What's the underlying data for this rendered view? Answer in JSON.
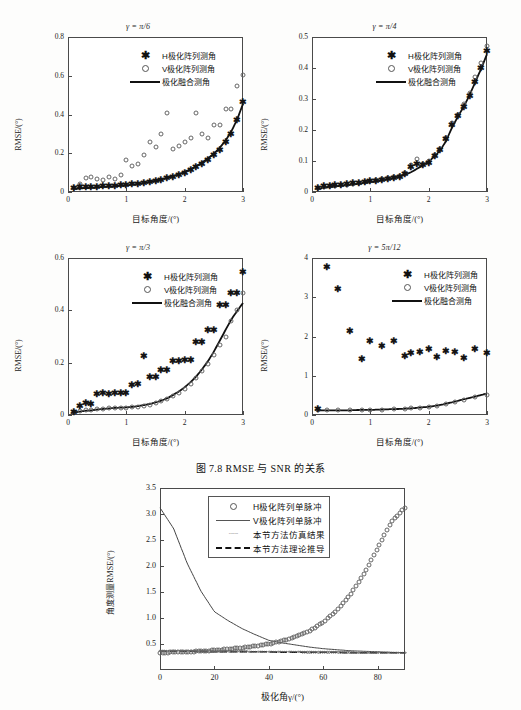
{
  "document": {
    "caption": "图 7.8   RMSE 与 SNR 的关系"
  },
  "legend_common": {
    "h_label": "H极化阵列测角",
    "v_label": "V极化阵列测角",
    "fusion_label": "极化融合测角"
  },
  "axis_labels": {
    "x_top": "目标角度/(°)",
    "y_top": "RMSE/(°)",
    "x_bottom": "极化角γ/(°)",
    "y_bottom": "角度测量RMSE/(°)"
  },
  "panels": [
    {
      "id": "panel-pi-6",
      "title": "γ = π/6",
      "xticks": [
        "0",
        "1",
        "2",
        "3"
      ],
      "yticks": [
        "0",
        "0.2",
        "0.4",
        "0.6",
        "0.8"
      ],
      "xlim": [
        0,
        3
      ],
      "ylim": [
        0,
        0.8
      ]
    },
    {
      "id": "panel-pi-4",
      "title": "γ = π/4",
      "xticks": [
        "0",
        "1",
        "2",
        "3"
      ],
      "yticks": [
        "0",
        "0.1",
        "0.2",
        "0.3",
        "0.4",
        "0.5"
      ],
      "xlim": [
        0,
        3
      ],
      "ylim": [
        0,
        0.5
      ]
    },
    {
      "id": "panel-pi-3",
      "title": "γ = π/3",
      "xticks": [
        "0",
        "1",
        "2",
        "3"
      ],
      "yticks": [
        "0",
        "0.2",
        "0.4",
        "0.6"
      ],
      "xlim": [
        0,
        3
      ],
      "ylim": [
        0,
        0.6
      ]
    },
    {
      "id": "panel-5pi-12",
      "title": "γ = 5π/12",
      "xticks": [
        "0",
        "1",
        "2",
        "3"
      ],
      "yticks": [
        "0",
        "1",
        "2",
        "3",
        "4"
      ],
      "xlim": [
        0,
        3
      ],
      "ylim": [
        0,
        4
      ]
    }
  ],
  "bottom_panel": {
    "id": "panel-polarization-angle",
    "xticks": [
      "0",
      "20",
      "40",
      "60",
      "80"
    ],
    "yticks": [
      "0.5",
      "1.0",
      "1.5",
      "2.0",
      "2.5",
      "3.0",
      "3.5"
    ],
    "xlim": [
      0,
      90
    ],
    "ylim": [
      0,
      3.5
    ],
    "legend": {
      "h_label": "H极化阵列单脉冲",
      "v_label": "V极化阵列单脉冲",
      "sim_label": "本节方法仿真结果",
      "theory_label": "本节方法理论推导"
    }
  },
  "chart_data": [
    {
      "type": "scatter",
      "id": "panel-pi-6",
      "title": "γ = π/6",
      "xlabel": "目标角度/(°)",
      "ylabel": "RMSE/(°)",
      "xlim": [
        0,
        3
      ],
      "ylim": [
        0,
        0.8
      ],
      "grid": false,
      "legend_position": "upper-center",
      "x": [
        0.1,
        0.2,
        0.3,
        0.4,
        0.5,
        0.6,
        0.7,
        0.8,
        0.9,
        1.0,
        1.1,
        1.2,
        1.3,
        1.4,
        1.5,
        1.6,
        1.7,
        1.8,
        1.9,
        2.0,
        2.1,
        2.2,
        2.3,
        2.4,
        2.5,
        2.6,
        2.7,
        2.8,
        2.9,
        3.0
      ],
      "series": [
        {
          "name": "H极化阵列测角",
          "marker": "star",
          "values": [
            0.02,
            0.025,
            0.025,
            0.025,
            0.028,
            0.03,
            0.03,
            0.032,
            0.035,
            0.035,
            0.04,
            0.04,
            0.045,
            0.05,
            0.055,
            0.06,
            0.07,
            0.08,
            0.09,
            0.1,
            0.115,
            0.13,
            0.145,
            0.165,
            0.19,
            0.215,
            0.26,
            0.3,
            0.37,
            0.465
          ]
        },
        {
          "name": "V极化阵列测角",
          "marker": "circle",
          "values": [
            0.02,
            0.04,
            0.07,
            0.075,
            0.065,
            0.06,
            0.075,
            0.065,
            0.09,
            0.165,
            0.135,
            0.145,
            0.19,
            0.26,
            0.23,
            0.3,
            0.41,
            0.22,
            0.24,
            0.26,
            0.28,
            0.41,
            0.3,
            0.28,
            0.345,
            0.345,
            0.43,
            0.43,
            0.545,
            0.605
          ]
        },
        {
          "name": "极化融合测角",
          "marker": "line",
          "values": [
            0.015,
            0.018,
            0.02,
            0.022,
            0.024,
            0.026,
            0.028,
            0.03,
            0.032,
            0.034,
            0.038,
            0.042,
            0.046,
            0.052,
            0.058,
            0.065,
            0.073,
            0.082,
            0.092,
            0.104,
            0.118,
            0.134,
            0.152,
            0.173,
            0.198,
            0.228,
            0.265,
            0.312,
            0.375,
            0.455
          ]
        }
      ]
    },
    {
      "type": "scatter",
      "id": "panel-pi-4",
      "title": "γ = π/4",
      "xlabel": "目标角度/(°)",
      "ylabel": "RMSE/(°)",
      "xlim": [
        0,
        3
      ],
      "ylim": [
        0,
        0.5
      ],
      "grid": false,
      "legend_position": "upper-center",
      "x": [
        0.1,
        0.2,
        0.3,
        0.4,
        0.5,
        0.6,
        0.7,
        0.8,
        0.9,
        1.0,
        1.1,
        1.2,
        1.3,
        1.4,
        1.5,
        1.6,
        1.7,
        1.8,
        1.9,
        2.0,
        2.1,
        2.2,
        2.3,
        2.4,
        2.5,
        2.6,
        2.7,
        2.8,
        2.9,
        3.0
      ],
      "series": [
        {
          "name": "H极化阵列测角",
          "marker": "star",
          "values": [
            0.012,
            0.018,
            0.02,
            0.022,
            0.022,
            0.025,
            0.028,
            0.03,
            0.032,
            0.034,
            0.036,
            0.04,
            0.042,
            0.046,
            0.05,
            0.058,
            0.082,
            0.09,
            0.088,
            0.095,
            0.115,
            0.135,
            0.17,
            0.215,
            0.245,
            0.275,
            0.31,
            0.355,
            0.4,
            0.455
          ]
        },
        {
          "name": "V极化阵列测角",
          "marker": "circle",
          "values": [
            0.012,
            0.015,
            0.018,
            0.018,
            0.022,
            0.024,
            0.026,
            0.03,
            0.032,
            0.034,
            0.038,
            0.042,
            0.044,
            0.048,
            0.052,
            0.062,
            0.088,
            0.105,
            0.09,
            0.1,
            0.12,
            0.14,
            0.175,
            0.222,
            0.25,
            0.285,
            0.318,
            0.37,
            0.415,
            0.47
          ]
        },
        {
          "name": "极化融合测角",
          "marker": "line",
          "values": [
            0.01,
            0.013,
            0.016,
            0.018,
            0.02,
            0.022,
            0.024,
            0.027,
            0.029,
            0.032,
            0.035,
            0.038,
            0.041,
            0.045,
            0.05,
            0.056,
            0.064,
            0.075,
            0.086,
            0.098,
            0.115,
            0.135,
            0.165,
            0.208,
            0.243,
            0.275,
            0.312,
            0.355,
            0.398,
            0.445
          ]
        }
      ]
    },
    {
      "type": "scatter",
      "id": "panel-pi-3",
      "title": "γ = π/3",
      "xlabel": "目标角度/(°)",
      "ylabel": "RMSE/(°)",
      "xlim": [
        0,
        3
      ],
      "ylim": [
        0,
        0.6
      ],
      "grid": false,
      "legend_position": "upper-center",
      "x": [
        0.1,
        0.2,
        0.3,
        0.4,
        0.5,
        0.6,
        0.7,
        0.8,
        0.9,
        1.0,
        1.1,
        1.2,
        1.3,
        1.4,
        1.5,
        1.6,
        1.7,
        1.8,
        1.9,
        2.0,
        2.1,
        2.2,
        2.3,
        2.4,
        2.5,
        2.6,
        2.7,
        2.8,
        2.9,
        3.0
      ],
      "series": [
        {
          "name": "H极化阵列测角",
          "marker": "star",
          "values": [
            0.012,
            0.035,
            0.045,
            0.042,
            0.082,
            0.085,
            0.082,
            0.085,
            0.085,
            0.085,
            0.115,
            0.118,
            0.225,
            0.145,
            0.145,
            0.172,
            0.172,
            0.205,
            0.208,
            0.21,
            0.21,
            0.278,
            0.28,
            0.325,
            0.325,
            0.42,
            0.42,
            0.465,
            0.465,
            0.545
          ]
        },
        {
          "name": "V极化阵列测角",
          "marker": "circle",
          "values": [
            0.012,
            0.015,
            0.018,
            0.02,
            0.022,
            0.024,
            0.026,
            0.028,
            0.028,
            0.028,
            0.03,
            0.032,
            0.036,
            0.04,
            0.045,
            0.052,
            0.06,
            0.072,
            0.085,
            0.1,
            0.118,
            0.14,
            0.168,
            0.195,
            0.23,
            0.268,
            0.3,
            0.36,
            0.4,
            0.465
          ]
        },
        {
          "name": "极化融合测角",
          "marker": "line",
          "values": [
            0.01,
            0.013,
            0.016,
            0.018,
            0.021,
            0.023,
            0.025,
            0.027,
            0.028,
            0.029,
            0.031,
            0.034,
            0.038,
            0.042,
            0.048,
            0.055,
            0.064,
            0.076,
            0.09,
            0.106,
            0.125,
            0.148,
            0.175,
            0.206,
            0.242,
            0.283,
            0.325,
            0.365,
            0.398,
            0.428
          ]
        }
      ]
    },
    {
      "type": "scatter",
      "id": "panel-5pi-12",
      "title": "γ = 5π/12",
      "xlabel": "目标角度/(°)",
      "ylabel": "RMSE/(°)",
      "xlim": [
        0,
        3
      ],
      "ylim": [
        0,
        4
      ],
      "grid": false,
      "legend_position": "upper-center",
      "x": [
        0.1,
        0.25,
        0.45,
        0.65,
        0.85,
        1.0,
        1.2,
        1.4,
        1.6,
        1.7,
        1.85,
        2.0,
        2.15,
        2.3,
        2.45,
        2.6,
        2.8,
        3.0
      ],
      "series": [
        {
          "name": "H极化阵列测角",
          "marker": "star",
          "values": [
            0.15,
            3.78,
            3.2,
            2.15,
            1.42,
            1.88,
            1.75,
            1.88,
            1.5,
            1.58,
            1.6,
            1.68,
            1.48,
            1.62,
            1.6,
            1.45,
            1.68,
            1.58
          ]
        },
        {
          "name": "V极化阵列测角",
          "marker": "circle",
          "values": [
            0.13,
            0.13,
            0.13,
            0.13,
            0.13,
            0.13,
            0.14,
            0.15,
            0.16,
            0.17,
            0.18,
            0.2,
            0.23,
            0.27,
            0.32,
            0.38,
            0.45,
            0.52
          ]
        },
        {
          "name": "极化融合测角",
          "marker": "line",
          "values": [
            0.12,
            0.12,
            0.12,
            0.12,
            0.13,
            0.13,
            0.14,
            0.15,
            0.16,
            0.17,
            0.19,
            0.21,
            0.24,
            0.29,
            0.34,
            0.4,
            0.47,
            0.55
          ]
        }
      ]
    },
    {
      "type": "line",
      "id": "panel-polarization-angle",
      "title": "",
      "xlabel": "极化角γ/(°)",
      "ylabel": "角度测量RMSE/(°)",
      "xlim": [
        0,
        90
      ],
      "ylim": [
        0,
        3.5
      ],
      "grid": false,
      "legend_position": "upper-center",
      "x": [
        0,
        5,
        10,
        15,
        20,
        25,
        30,
        35,
        40,
        45,
        50,
        55,
        60,
        65,
        70,
        75,
        80,
        85,
        90
      ],
      "series": [
        {
          "name": "H极化阵列单脉冲",
          "marker": "circle",
          "values": [
            0.33,
            0.34,
            0.35,
            0.36,
            0.38,
            0.4,
            0.43,
            0.46,
            0.5,
            0.56,
            0.64,
            0.75,
            0.92,
            1.15,
            1.45,
            1.85,
            2.35,
            2.85,
            3.12
          ]
        },
        {
          "name": "V极化阵列单脉冲",
          "marker": "line",
          "values": [
            3.12,
            2.72,
            2.05,
            1.52,
            1.12,
            0.95,
            0.8,
            0.68,
            0.57,
            0.52,
            0.48,
            0.44,
            0.41,
            0.39,
            0.37,
            0.36,
            0.35,
            0.34,
            0.33
          ]
        },
        {
          "name": "本节方法仿真结果",
          "marker": "dots",
          "values": [
            0.37,
            0.37,
            0.37,
            0.36,
            0.36,
            0.36,
            0.36,
            0.35,
            0.35,
            0.35,
            0.35,
            0.34,
            0.34,
            0.34,
            0.34,
            0.33,
            0.33,
            0.33,
            0.33
          ]
        },
        {
          "name": "本节方法理论推导",
          "marker": "dashed",
          "values": [
            0.36,
            0.36,
            0.36,
            0.36,
            0.35,
            0.35,
            0.35,
            0.35,
            0.35,
            0.34,
            0.34,
            0.34,
            0.34,
            0.34,
            0.33,
            0.33,
            0.33,
            0.33,
            0.33
          ]
        }
      ]
    }
  ]
}
